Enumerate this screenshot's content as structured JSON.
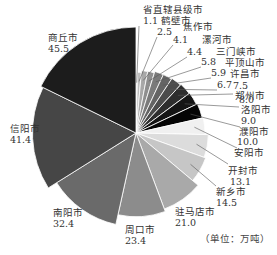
{
  "chart_data": {
    "type": "pie",
    "title": "",
    "unit_note": "（单位：万吨）",
    "start_angle_deg": 0,
    "direction": "clockwise",
    "radius_varies_with_value": true,
    "slices": [
      {
        "label": "省直辖县级市",
        "value": 1.1,
        "color": "#d0d0d0"
      },
      {
        "label": "鹤壁市",
        "value": 2.5,
        "color": "#bcbcbc"
      },
      {
        "label": "焦作市",
        "value": 4.1,
        "color": "#a8a8a8"
      },
      {
        "label": "漯河市",
        "value": 4.4,
        "color": "#8e8e8e"
      },
      {
        "label": "三门峡市",
        "value": 5.8,
        "color": "#7a7a7a"
      },
      {
        "label": "平顶山市",
        "value": 5.9,
        "color": "#646464"
      },
      {
        "label": "许昌市",
        "value": 6.7,
        "color": "#4c4c4c"
      },
      {
        "label": "郑州市",
        "value": 7.5,
        "color": "#2e2e2e"
      },
      {
        "label": "洛阳市",
        "value": 8.0,
        "color": "#151515"
      },
      {
        "label": "濮阳市",
        "value": 9.0,
        "color": "#050505"
      },
      {
        "label": "安阳市",
        "value": 10.0,
        "color": "#f0f0f0"
      },
      {
        "label": "开封市",
        "value": 13.1,
        "color": "#dcdcdc"
      },
      {
        "label": "新乡市",
        "value": 14.5,
        "color": "#c6c6c6"
      },
      {
        "label": "驻马店市",
        "value": 21.0,
        "color": "#a9a9a9"
      },
      {
        "label": "周口市",
        "value": 23.4,
        "color": "#8c8c8c"
      },
      {
        "label": "南阳市",
        "value": 32.4,
        "color": "#6a6a6a"
      },
      {
        "label": "信阳市",
        "value": 41.4,
        "color": "#464646"
      },
      {
        "label": "商丘市",
        "value": 45.5,
        "color": "#1c1c1c"
      }
    ],
    "labels": [
      {
        "name": "省直辖县级市",
        "value": "1.1",
        "nx": 143,
        "ny": 13,
        "vx": 143,
        "vy": 24,
        "lx": 139,
        "ly": 26
      },
      {
        "name": "鹤壁市",
        "value": "2.5",
        "nx": 161,
        "ny": 24,
        "vx": 157,
        "vy": 35,
        "lx": 157,
        "ly": 37
      },
      {
        "name": "焦作市",
        "value": "4.1",
        "nx": 183,
        "ny": 30,
        "vx": 173,
        "vy": 43,
        "lx": 173,
        "ly": 45
      },
      {
        "name": "漯河市",
        "value": "4.4",
        "nx": 202,
        "ny": 43,
        "vx": 187,
        "vy": 55,
        "lx": 187,
        "ly": 57
      },
      {
        "name": "三门峡市",
        "value": "5.8",
        "nx": 216,
        "ny": 55,
        "vx": 201,
        "vy": 65,
        "lx": 201,
        "ly": 67
      },
      {
        "name": "平顶山市",
        "value": "5.9",
        "nx": 225,
        "ny": 66,
        "vx": 211,
        "vy": 76,
        "lx": 211,
        "ly": 78
      },
      {
        "name": "许昌市",
        "value": "6.7",
        "nx": 230,
        "ny": 77,
        "vx": 217,
        "vy": 88,
        "lx": 217,
        "ly": 90
      },
      {
        "name": "郑州市",
        "value": "7.5",
        "nx": 235,
        "ny": 99,
        "vx": 233,
        "vy": 89,
        "lx": 233,
        "ly": 94
      },
      {
        "name": "洛阳市",
        "value": "8.0",
        "nx": 241,
        "ny": 113,
        "vx": 239,
        "vy": 103,
        "lx": 239,
        "ly": 107
      },
      {
        "name": "濮阳市",
        "value": "9.0",
        "nx": 239,
        "ny": 135,
        "vx": 241,
        "vy": 124,
        "lx": 240,
        "ly": 127
      },
      {
        "name": "安阳市",
        "value": "10.0",
        "nx": 234,
        "ny": 156,
        "vx": 237,
        "vy": 145,
        "lx": 237,
        "ly": 148
      },
      {
        "name": "开封市",
        "value": "13.1",
        "nx": 228,
        "ny": 174,
        "vx": 230,
        "vy": 185,
        "lx": 228,
        "ly": 164
      },
      {
        "name": "新乡市",
        "value": "14.5",
        "nx": 216,
        "ny": 195,
        "vx": 216,
        "vy": 206,
        "lx": 216,
        "ly": 186
      },
      {
        "name": "驻马店市",
        "value": "21.0",
        "nx": 175,
        "ny": 215,
        "vx": 175,
        "vy": 226,
        "lx": 0,
        "ly": 0
      },
      {
        "name": "周口市",
        "value": "23.4",
        "nx": 125,
        "ny": 233,
        "vx": 125,
        "vy": 244,
        "lx": 0,
        "ly": 0
      },
      {
        "name": "南阳市",
        "value": "32.4",
        "nx": 53,
        "ny": 216,
        "vx": 53,
        "vy": 227,
        "lx": 0,
        "ly": 0
      },
      {
        "name": "信阳市",
        "value": "41.4",
        "nx": 10,
        "ny": 132,
        "vx": 10,
        "vy": 143,
        "lx": 0,
        "ly": 0
      },
      {
        "name": "商丘市",
        "value": "45.5",
        "nx": 48,
        "ny": 41,
        "vx": 48,
        "vy": 52,
        "lx": 0,
        "ly": 0
      }
    ],
    "center": [
      136,
      133
    ]
  }
}
